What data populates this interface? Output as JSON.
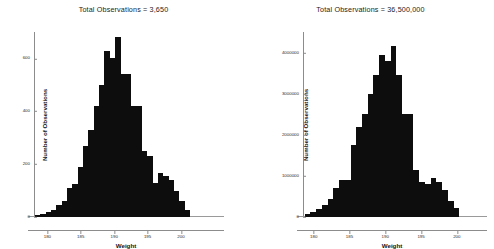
{
  "figure": {
    "background": "#ffffff",
    "bar_color": "#0d0d0d",
    "axis_color": "#8c8c8c"
  },
  "panels": [
    {
      "name": "left",
      "title": "Total Observations = 3,650",
      "xlabel": "Weight",
      "ylabel": "Number of Observations",
      "yticks": [
        "0",
        "200",
        "400",
        "600"
      ],
      "xticks": [
        "180",
        "185",
        "190",
        "195",
        "200"
      ]
    },
    {
      "name": "right",
      "title": "Total Observations = 36,500,000",
      "xlabel": "Weight",
      "ylabel": "Number of Observations",
      "yticks": [
        "0",
        "1000000",
        "2000000",
        "3000000",
        "4000000"
      ],
      "xticks": [
        "180",
        "185",
        "190",
        "195",
        "200"
      ]
    }
  ],
  "chart_data": [
    {
      "type": "bar",
      "subtype": "histogram",
      "title": "Total Observations = 3,650",
      "xlabel": "Weight",
      "ylabel": "Number of Observations",
      "xlim": [
        178.0,
        203.0
      ],
      "ylim": [
        0,
        700
      ],
      "yticks": [
        0,
        200,
        400,
        600
      ],
      "xticks": [
        180,
        185,
        190,
        195,
        200
      ],
      "grid": false,
      "legend": "none",
      "bin_width": 0.8,
      "bin_centers": [
        178.4,
        179.2,
        180.0,
        180.8,
        181.6,
        182.4,
        183.2,
        184.0,
        184.8,
        185.6,
        186.4,
        187.2,
        188.0,
        188.8,
        189.6,
        190.4,
        191.2,
        192.0,
        192.8,
        193.6,
        194.4,
        195.2,
        196.0,
        196.8,
        197.6,
        198.4,
        199.2,
        200.0,
        200.8
      ],
      "values": [
        8,
        12,
        20,
        28,
        45,
        60,
        110,
        125,
        190,
        270,
        330,
        420,
        500,
        630,
        600,
        680,
        540,
        540,
        420,
        420,
        250,
        230,
        130,
        165,
        155,
        140,
        100,
        60,
        25
      ]
    },
    {
      "type": "bar",
      "subtype": "histogram",
      "title": "Total Observations = 36,500,000",
      "xlabel": "Weight",
      "ylabel": "Number of Observations",
      "xlim": [
        178.5,
        201.0
      ],
      "ylim": [
        0,
        4500000
      ],
      "yticks": [
        0,
        1000000,
        2000000,
        3000000,
        4000000
      ],
      "xticks": [
        180,
        185,
        190,
        195,
        200
      ],
      "grid": false,
      "legend": "none",
      "bin_width": 0.8,
      "bin_centers": [
        179.0,
        179.8,
        180.6,
        181.4,
        182.2,
        183.0,
        183.8,
        184.6,
        185.4,
        186.2,
        187.0,
        187.8,
        188.6,
        189.4,
        190.2,
        191.0,
        191.8,
        192.6,
        193.4,
        194.2,
        195.0,
        195.8,
        196.6,
        197.4,
        198.2,
        199.0,
        199.8
      ],
      "values": [
        80000,
        130000,
        200000,
        300000,
        450000,
        700000,
        900000,
        900000,
        1750000,
        2200000,
        2500000,
        3000000,
        3450000,
        3950000,
        3800000,
        4150000,
        3450000,
        2500000,
        2500000,
        1150000,
        850000,
        800000,
        950000,
        850000,
        650000,
        400000,
        220000
      ]
    }
  ]
}
